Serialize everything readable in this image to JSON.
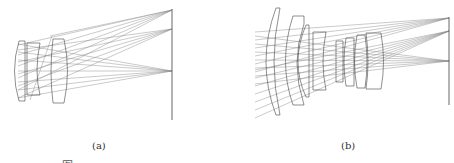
{
  "figure": {
    "panels": [
      {
        "label": "(a)",
        "description": "Ray-trace layout of a compact lens system focusing three field bundles onto an image plane",
        "image_plane": {
          "x": 172,
          "y_top": 9,
          "y_bottom": 120
        },
        "focus_points_y": [
          10,
          29,
          71
        ],
        "lens_count": 3
      },
      {
        "label": "(b)",
        "description": "Ray-trace layout of a multi-element wide-field lens system focusing three field bundles onto an image plane",
        "image_plane": {
          "x": 449,
          "y_top": 17,
          "y_bottom": 105
        },
        "focus_points_y": [
          18,
          31,
          61
        ],
        "lens_count": 8
      }
    ],
    "caption_partial": "图"
  },
  "colors": {
    "line": "#555555",
    "ray": "#777777",
    "background": "#ffffff"
  }
}
